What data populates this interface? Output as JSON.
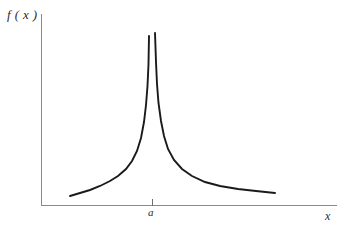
{
  "figure": {
    "background_color": "#ffffff",
    "axis_color": "#8a8a8a",
    "curve_color": "#1a1a1a"
  },
  "labels": {
    "ylabel": "f ( x )",
    "xlabel": "x",
    "tick_a": "a"
  },
  "chart_data": {
    "type": "line",
    "title": "",
    "subtitle": "",
    "xlabel": "x",
    "ylabel": "f ( x )",
    "grid": false,
    "legend": "none",
    "annotations": [
      {
        "text": "a",
        "x": 152,
        "kind": "x-axis-tick-label",
        "meaning": "location of the vertical asymptote"
      }
    ],
    "axes": {
      "x_axis": {
        "x_start_px": 41,
        "x_end_px": 337,
        "y_px": 205,
        "ticks": [
          "a"
        ],
        "tick_positions_px": [
          152
        ]
      },
      "y_axis": {
        "x_px": 41,
        "y_top_px": 14,
        "y_bottom_px": 205,
        "ticks": []
      }
    },
    "series": [
      {
        "name": "left-branch",
        "points_px": [
          [
            70,
            196
          ],
          [
            80,
            193
          ],
          [
            90,
            190
          ],
          [
            100,
            186
          ],
          [
            110,
            181
          ],
          [
            118,
            176
          ],
          [
            126,
            169
          ],
          [
            132,
            161
          ],
          [
            137,
            151
          ],
          [
            141,
            138
          ],
          [
            144,
            122
          ],
          [
            146,
            105
          ],
          [
            147.5,
            86
          ],
          [
            148.5,
            64
          ],
          [
            149,
            36
          ]
        ]
      },
      {
        "name": "right-branch",
        "points_px": [
          [
            155,
            33
          ],
          [
            156,
            62
          ],
          [
            157,
            84
          ],
          [
            158.5,
            103
          ],
          [
            161,
            121
          ],
          [
            164,
            136
          ],
          [
            168,
            149
          ],
          [
            174,
            160
          ],
          [
            182,
            169
          ],
          [
            192,
            176
          ],
          [
            205,
            182
          ],
          [
            220,
            186
          ],
          [
            238,
            189
          ],
          [
            256,
            191
          ],
          [
            275,
            193
          ]
        ]
      }
    ]
  }
}
